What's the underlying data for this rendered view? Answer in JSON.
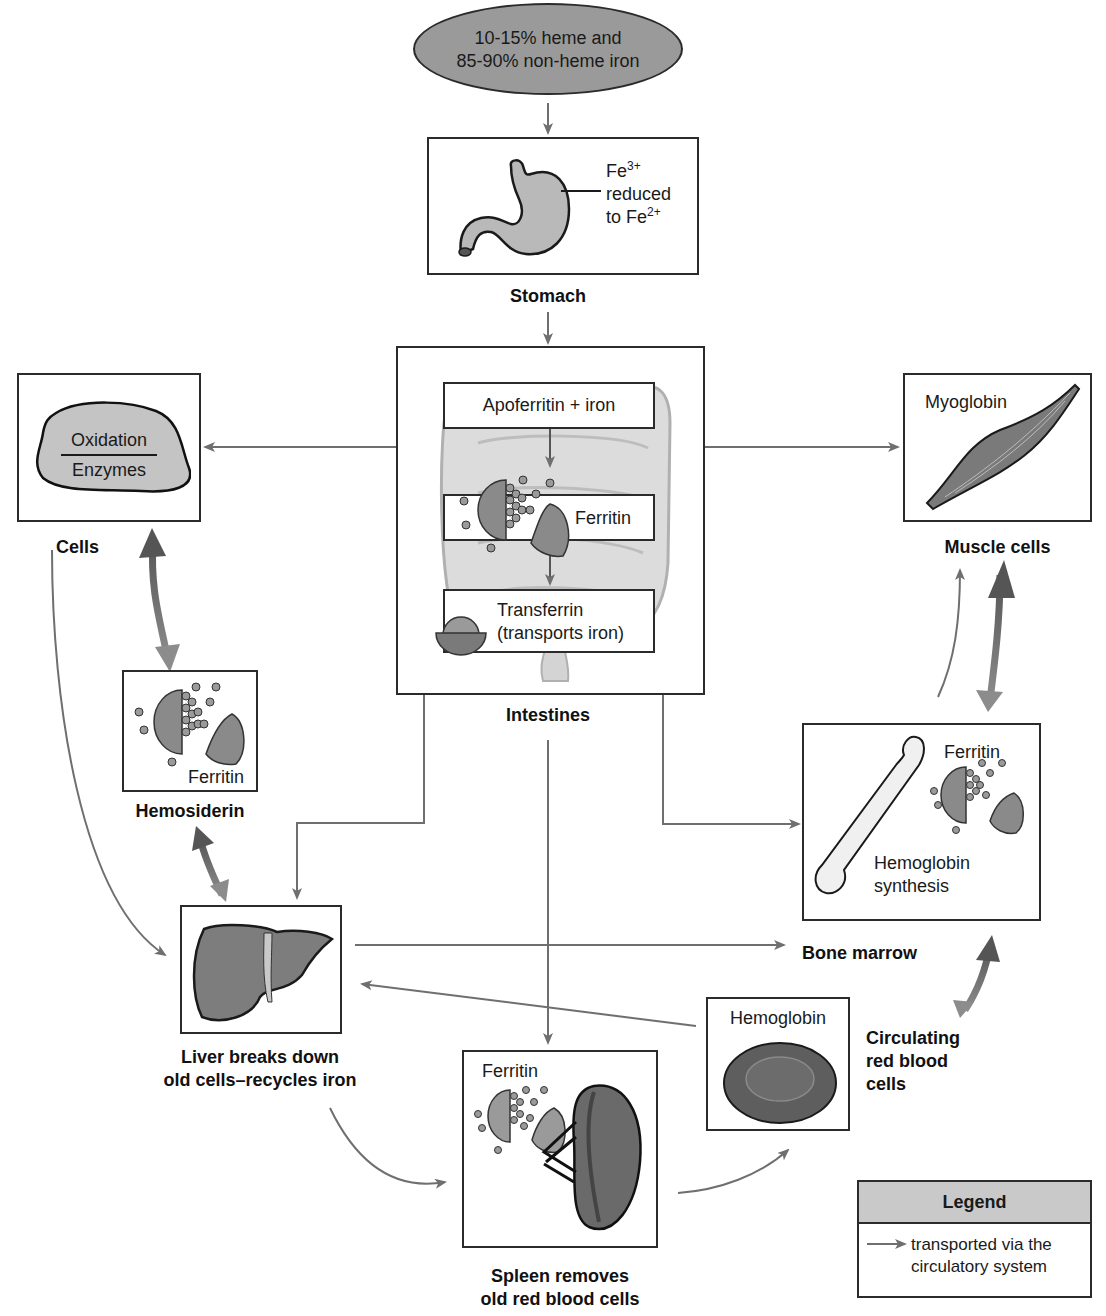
{
  "diagram": {
    "colors": {
      "line": "#6f6f6f",
      "box_border": "#2b2b2b",
      "source_oval": "#9a9a9a",
      "organ_fill": "#8a8a8a",
      "legend_header": "#c9c9c9"
    }
  },
  "source": {
    "line1": "10-15% heme and",
    "line2": "85-90% non-heme iron"
  },
  "stomach": {
    "label": "Stomach",
    "annotation_fe3": "Fe",
    "annotation_fe3_sup": "3+",
    "annotation_reduced": "reduced",
    "annotation_to": "to Fe",
    "annotation_fe2_sup": "2+"
  },
  "intestines": {
    "label": "Intestines",
    "step1": "Apoferritin + iron",
    "step2": "Ferritin",
    "step3_line1": "Transferrin",
    "step3_line2": "(transports iron)"
  },
  "cells": {
    "label": "Cells",
    "top": "Oxidation",
    "bottom": "Enzymes"
  },
  "hemosiderin": {
    "label": "Hemosiderin",
    "inner": "Ferritin"
  },
  "muscle": {
    "label": "Muscle cells",
    "inner": "Myoglobin"
  },
  "bone_marrow": {
    "label": "Bone marrow",
    "inner_top": "Ferritin",
    "inner_line1": "Hemoglobin",
    "inner_line2": "synthesis"
  },
  "liver": {
    "label_line1": "Liver breaks down",
    "label_line2": "old cells–recycles iron"
  },
  "spleen": {
    "label_line1": "Spleen removes",
    "label_line2": "old red blood cells",
    "inner": "Ferritin"
  },
  "rbc": {
    "inner": "Hemoglobin",
    "label_line1": "Circulating",
    "label_line2": "red blood",
    "label_line3": "cells"
  },
  "legend": {
    "title": "Legend",
    "item_line1": "transported via the",
    "item_line2": "circulatory system"
  }
}
